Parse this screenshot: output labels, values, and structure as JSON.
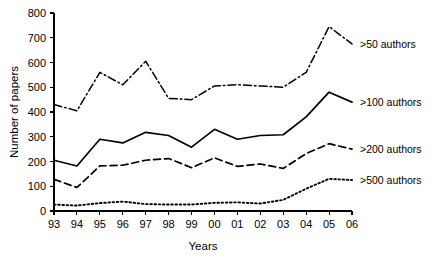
{
  "chart_data": {
    "type": "line",
    "title": "",
    "xlabel": "Years",
    "ylabel": "Number of papers",
    "x": [
      "93",
      "94",
      "95",
      "96",
      "97",
      "98",
      "99",
      "00",
      "01",
      "02",
      "03",
      "04",
      "05",
      "06"
    ],
    "categories": [
      "93",
      "94",
      "95",
      "96",
      "97",
      "98",
      "99",
      "00",
      "01",
      "02",
      "03",
      "04",
      "05",
      "06"
    ],
    "xlim": [
      0,
      13
    ],
    "ylim": [
      0,
      800
    ],
    "yticks": [
      0,
      100,
      200,
      300,
      400,
      500,
      600,
      700,
      800
    ],
    "ytick_labels": [
      "0",
      "100",
      "200",
      "300",
      "400",
      "500",
      "600",
      "700",
      "800"
    ],
    "grid": false,
    "legend_position": "right-inline",
    "series": [
      {
        "name": ">50 authors",
        "label": ">50 authors",
        "dash": "dash-dot",
        "values": [
          430,
          405,
          560,
          510,
          605,
          455,
          450,
          505,
          510,
          505,
          500,
          560,
          745,
          675
        ]
      },
      {
        "name": ">100 authors",
        "label": ">100 authors",
        "dash": "solid",
        "values": [
          205,
          182,
          290,
          275,
          318,
          305,
          258,
          330,
          290,
          305,
          308,
          380,
          480,
          440
        ]
      },
      {
        "name": ">200 authors",
        "label": ">200 authors",
        "dash": "dashed",
        "values": [
          128,
          95,
          182,
          185,
          205,
          212,
          175,
          215,
          180,
          190,
          172,
          232,
          272,
          250
        ]
      },
      {
        "name": ">500 authors",
        "label": ">500 authors",
        "dash": "dotted",
        "values": [
          26,
          22,
          32,
          38,
          28,
          26,
          26,
          33,
          35,
          30,
          45,
          90,
          130,
          125
        ]
      }
    ]
  },
  "axes": {
    "y_title": "Number of papers",
    "x_title": "Years"
  },
  "colors": {
    "line": "#000000",
    "background": "#ffffff",
    "text": "#000000"
  }
}
